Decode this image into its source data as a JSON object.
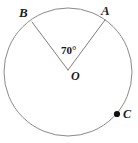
{
  "figure": {
    "kind": "circle-central-angle-diagram",
    "background_color": "#ffffff",
    "stroke_color": "#8a8a8a",
    "ray_stroke_color": "#7d7d7d",
    "point_color": "#111111",
    "text_color": "#1d1d1d"
  },
  "labels": {
    "point_a": "A",
    "point_b": "B",
    "point_c": "C",
    "center_o": "O",
    "angle_value": "70°"
  },
  "chart_data": {
    "type": "scatter",
    "title": "",
    "xlabel": "",
    "ylabel": "",
    "grid": false,
    "legend_position": "none",
    "circle": {
      "center_x": 68,
      "center_y": 72,
      "radius": 64,
      "stroke_width": 1
    },
    "points": [
      {
        "name": "A",
        "x": 105,
        "y": 20,
        "marker": "none",
        "label": "A",
        "label_x": 107,
        "label_y": 11,
        "on_circle": true
      },
      {
        "name": "B",
        "x": 32,
        "y": 22,
        "marker": "none",
        "label": "B",
        "label_x": 24,
        "label_y": 13,
        "on_circle": true
      },
      {
        "name": "O",
        "x": 68,
        "y": 70,
        "marker": "none",
        "label": "O",
        "label_x": 74,
        "label_y": 77,
        "on_circle": false
      },
      {
        "name": "C",
        "x": 117,
        "y": 114,
        "marker": "filled-dot",
        "label": "C",
        "label_x": 126,
        "label_y": 115,
        "on_circle": true
      }
    ],
    "segments": [
      {
        "name": "radius-OA",
        "from": "O",
        "to": "A",
        "x1": 68,
        "y1": 70,
        "x2": 105,
        "y2": 20
      },
      {
        "name": "radius-OB",
        "from": "O",
        "to": "B",
        "x1": 68,
        "y1": 70,
        "x2": 32,
        "y2": 22
      }
    ],
    "angles": [
      {
        "name": "central-angle-AOB",
        "vertex": "O",
        "rays": [
          "OB",
          "OA"
        ],
        "value": 70,
        "unit": "degrees",
        "label": "70°",
        "label_x": 66,
        "label_y": 51
      }
    ]
  }
}
